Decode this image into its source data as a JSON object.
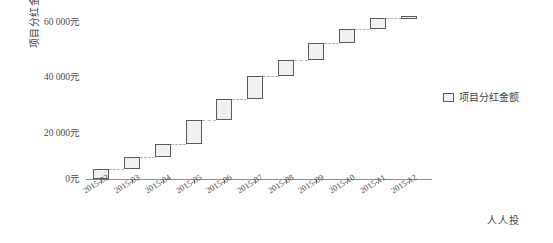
{
  "chart_data": {
    "type": "bar",
    "subtype": "waterfall",
    "title": "",
    "xlabel": "",
    "ylabel": "项目分红金额趋势",
    "categories": [
      "2015-02",
      "2015-03",
      "2015-04",
      "2015-05",
      "2015-06",
      "2015-07",
      "2015-08",
      "2015-09",
      "2015-10",
      "2015-11",
      "2015-12"
    ],
    "series": [
      {
        "name": "项目分红金额",
        "bar_start": [
          0,
          4000,
          8500,
          13500,
          23000,
          31000,
          40000,
          46500,
          53000,
          58500,
          62500
        ],
        "bar_end": [
          4000,
          8500,
          13500,
          23000,
          31000,
          40000,
          46500,
          53000,
          58500,
          62500,
          63500
        ],
        "increments": [
          4000,
          4500,
          5000,
          9500,
          8000,
          9000,
          6500,
          6500,
          5500,
          4000,
          1000
        ],
        "cumulative": [
          4000,
          8500,
          13500,
          23000,
          31000,
          40000,
          46500,
          53000,
          58500,
          62500,
          63500
        ]
      }
    ],
    "ylim": [
      0,
      65000
    ],
    "y_ticks": [
      0,
      20000,
      40000,
      60000
    ],
    "y_tick_labels": [
      "0元",
      "20 000元",
      "40 000元",
      "60 000元"
    ],
    "grid": false,
    "legend_position": "right",
    "connector_style": "dashed"
  },
  "axes": {
    "y_title": "项目分红金额趋势",
    "y_tick_labels": [
      "60 000元",
      "40 000元",
      "20 000元",
      "0元"
    ],
    "x_tick_labels": [
      "2015-02",
      "2015-03",
      "2015-04",
      "2015-05",
      "2015-06",
      "2015-07",
      "2015-08",
      "2015-09",
      "2015-10",
      "2015-11",
      "2015-12"
    ]
  },
  "legend": {
    "entries": [
      {
        "label": "项目分红金额",
        "swatch_fill": "#f1f1f1",
        "swatch_border": "#5a5a5a"
      }
    ]
  },
  "footer": {
    "source_label": "人人投"
  },
  "colors": {
    "bar_fill": "#f1f1f1",
    "bar_border": "#5a5a5a",
    "connector": "#b4b4b4",
    "axis": "#8d8d8d",
    "text": "#4a4a4a",
    "background": "#ffffff"
  }
}
